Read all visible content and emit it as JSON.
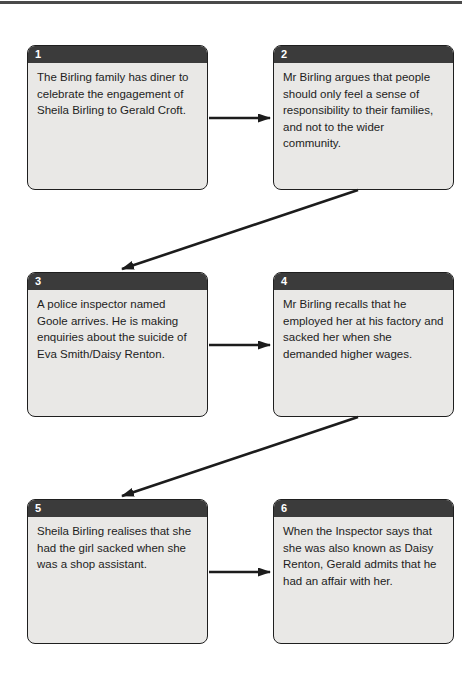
{
  "colors": {
    "page_background": "#ffffff",
    "top_rule": "#4a4a4a",
    "box_header_bg": "#3b3b3b",
    "box_body_bg": "#e9e8e6",
    "box_border": "#1f1f1f",
    "number_text": "#ffffff",
    "body_text": "#1d1d1d",
    "arrow": "#1c1c1c"
  },
  "diagram": {
    "type": "flowchart",
    "boxes": [
      {
        "number": "1",
        "text": "The Birling family has diner to celebrate the engagement of Sheila Birling to Gerald Croft."
      },
      {
        "number": "2",
        "text": "Mr Birling argues that people should only feel a sense of responsibility to their families, and not to the wider community."
      },
      {
        "number": "3",
        "text": "A police inspector named Goole arrives. He is making enquiries about the suicide of Eva Smith/Daisy Renton."
      },
      {
        "number": "4",
        "text": "Mr Birling recalls that he employed her at his factory and sacked her when she demanded higher wages."
      },
      {
        "number": "5",
        "text": "Sheila Birling realises that she had the girl sacked when she was a shop assistant."
      },
      {
        "number": "6",
        "text": "When the Inspector says that she was also known as Daisy Renton, Gerald admits that he had an affair with her."
      }
    ],
    "connections": [
      {
        "from": "1",
        "to": "2"
      },
      {
        "from": "2",
        "to": "3"
      },
      {
        "from": "3",
        "to": "4"
      },
      {
        "from": "4",
        "to": "5"
      },
      {
        "from": "5",
        "to": "6"
      }
    ]
  }
}
